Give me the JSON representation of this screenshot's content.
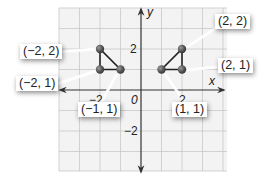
{
  "diagram": {
    "type": "coordinate-plane",
    "axes": {
      "x_label": "x",
      "y_label": "y",
      "origin_label": "0",
      "x_ticks": [
        {
          "value": -2,
          "label": "−2"
        },
        {
          "value": 2,
          "label": "2"
        }
      ],
      "y_ticks": [
        {
          "value": 2,
          "label": "2"
        },
        {
          "value": -2,
          "label": "−2"
        }
      ],
      "x_range": [
        -4,
        4
      ],
      "y_range": [
        -4,
        4
      ],
      "grid": true
    },
    "colors": {
      "grid": "#c8c8c8",
      "grid_background": "#f2f2f2",
      "axis": "#333333",
      "point": "#555555",
      "segment": "#222222"
    },
    "figures": [
      {
        "name": "left-triangle",
        "vertices": [
          {
            "x": -2,
            "y": 2,
            "label": "(−2, 2)"
          },
          {
            "x": -2,
            "y": 1,
            "label": "(−2, 1)"
          },
          {
            "x": -1,
            "y": 1,
            "label": "(−1, 1)"
          }
        ]
      },
      {
        "name": "right-triangle",
        "vertices": [
          {
            "x": 2,
            "y": 2,
            "label": "(2, 2)"
          },
          {
            "x": 2,
            "y": 1,
            "label": "(2, 1)"
          },
          {
            "x": 1,
            "y": 1,
            "label": "(1, 1)"
          }
        ]
      }
    ]
  }
}
